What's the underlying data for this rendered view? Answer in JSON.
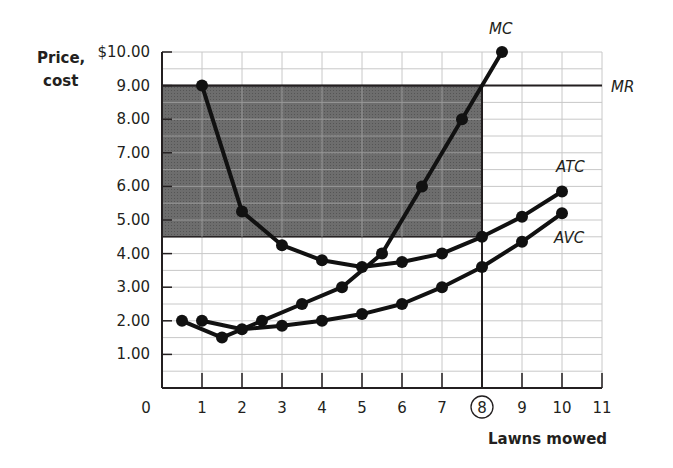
{
  "chart_data": {
    "type": "line",
    "title": "",
    "xlabel": "Lawns mowed",
    "ylabel": "Price, cost",
    "xlim": [
      0,
      11
    ],
    "ylim": [
      0,
      10
    ],
    "x_ticks": [
      "0",
      "1",
      "2",
      "3",
      "4",
      "5",
      "6",
      "7",
      "8",
      "9",
      "10",
      "11"
    ],
    "y_ticks": [
      "$10.00",
      "9.00",
      "8.00",
      "7.00",
      "6.00",
      "5.00",
      "4.00",
      "3.00",
      "2.00",
      "1.00"
    ],
    "highlighted_x_tick": "8",
    "grid": true,
    "series": [
      {
        "name": "MC",
        "x": [
          0.5,
          1.5,
          2.5,
          3.5,
          4.5,
          5.5,
          6.5,
          7.5,
          8.5
        ],
        "y": [
          2.0,
          1.5,
          2.0,
          2.5,
          3.0,
          4.0,
          6.0,
          8.0,
          10.0
        ]
      },
      {
        "name": "ATC",
        "x": [
          1,
          2,
          3,
          4,
          5,
          6,
          7,
          8,
          9,
          10
        ],
        "y": [
          9.0,
          5.25,
          4.25,
          3.8,
          3.6,
          3.75,
          4.0,
          4.5,
          5.1,
          5.85
        ]
      },
      {
        "name": "AVC",
        "x": [
          1,
          2,
          3,
          4,
          5,
          6,
          7,
          8,
          9,
          10
        ],
        "y": [
          2.0,
          1.75,
          1.85,
          2.0,
          2.2,
          2.5,
          3.0,
          3.6,
          4.35,
          5.2
        ]
      }
    ],
    "hlines": [
      {
        "name": "MR",
        "y": 9.0
      }
    ],
    "vlines": [
      {
        "x": 8
      }
    ],
    "shaded_region": {
      "x": [
        0,
        8
      ],
      "y": [
        4.5,
        9.0
      ],
      "label": "profit area"
    },
    "annotations": [
      "MC",
      "MR",
      "ATC",
      "AVC"
    ]
  },
  "labels": {
    "ylabel_line1": "Price,",
    "ylabel_line2": "cost",
    "xlabel": "Lawns mowed",
    "mc": "MC",
    "mr": "MR",
    "atc": "ATC",
    "avc": "AVC"
  }
}
